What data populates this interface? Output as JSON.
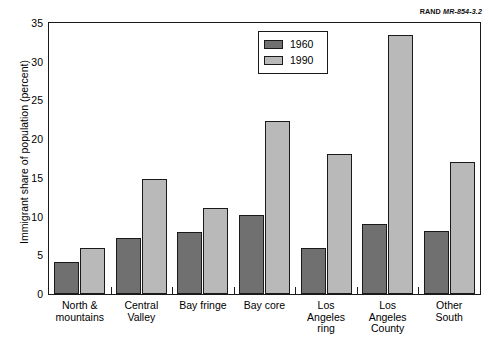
{
  "source_tag": {
    "mark": "RAND",
    "id": "MR-854-3.2"
  },
  "chart_data": {
    "type": "bar",
    "title": "",
    "subtitle": "",
    "xlabel": "",
    "ylabel": "Immigrant share of population (percent)",
    "ylim": [
      0,
      35
    ],
    "yticks": [
      0,
      5,
      10,
      15,
      20,
      25,
      30,
      35
    ],
    "ytick_labels": [
      "0",
      "5",
      "10",
      "15",
      "20",
      "25",
      "30",
      "35"
    ],
    "grid": false,
    "legend_position": "top-center",
    "categories": [
      "North &\nmountains",
      "Central\nValley",
      "Bay fringe",
      "Bay core",
      "Los\nAngeles\nring",
      "Los\nAngeles\nCounty",
      "Other\nSouth"
    ],
    "series": [
      {
        "name": "1960",
        "color": "#707070",
        "values": [
          4.1,
          7.2,
          8.0,
          10.2,
          6.0,
          9.0,
          8.1
        ]
      },
      {
        "name": "1990",
        "color": "#b9b9b9",
        "values": [
          6.0,
          14.9,
          11.1,
          22.4,
          18.1,
          33.5,
          17.0
        ]
      }
    ]
  },
  "legend": {
    "entries": [
      {
        "label": "1960",
        "color": "#707070"
      },
      {
        "label": "1990",
        "color": "#b9b9b9"
      }
    ]
  },
  "colors": {
    "series_1960": "#707070",
    "series_1990": "#b9b9b9",
    "axis": "#1a1a1a",
    "background": "#ffffff"
  }
}
